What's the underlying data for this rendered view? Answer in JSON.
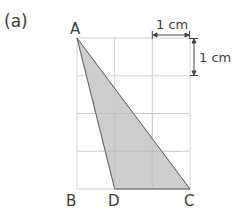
{
  "part_label": "(a)",
  "vertices": {
    "A": "A",
    "B": "B",
    "C": "C",
    "D": "D"
  },
  "scale": {
    "horizontal": "1 cm",
    "vertical": "1 cm"
  },
  "grid": {
    "columns": 3,
    "rows": 4,
    "cell_cm": 1
  },
  "shape": {
    "type": "triangle",
    "points": [
      "A",
      "D",
      "C"
    ],
    "fill": "#c8c8c8",
    "stroke": "#555555"
  },
  "colors": {
    "grid": "#d0d0d0",
    "text": "#3a3a3a"
  }
}
